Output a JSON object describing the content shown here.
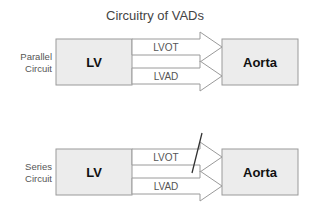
{
  "title": "Circuitry of VADs",
  "diagrams": [
    {
      "side_label_line1": "Parallel",
      "side_label_line2": "Circuit",
      "source_box": "LV",
      "target_box": "Aorta",
      "arrows": [
        {
          "label": "LVOT",
          "blocked": false
        },
        {
          "label": "LVAD",
          "blocked": false
        }
      ]
    },
    {
      "side_label_line1": "Series",
      "side_label_line2": "Circuit",
      "source_box": "LV",
      "target_box": "Aorta",
      "arrows": [
        {
          "label": "LVOT",
          "blocked": true
        },
        {
          "label": "LVAD",
          "blocked": false
        }
      ]
    }
  ],
  "colors": {
    "box_fill": "#ececec",
    "stroke": "#9a9a9a",
    "text": "#111111"
  }
}
